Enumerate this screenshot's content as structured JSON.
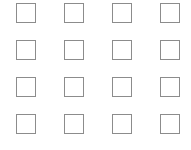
{
  "grid": {
    "name": "checkbox-grid",
    "rows": 4,
    "columns": 4,
    "total": 16,
    "background_color": "#ffffff",
    "box": {
      "width_px": 20,
      "height_px": 20,
      "border_width_px": 1,
      "border_color": "#8c8c8c",
      "fill_color": "#ffffff"
    },
    "layout": {
      "origin_x_px": 16,
      "origin_y_px": 3,
      "column_pitch_px": 48,
      "row_pitch_px": 37
    },
    "items": [
      {
        "name": "checkbox-r1c1",
        "row": 1,
        "column": 1,
        "x": 16,
        "y": 3,
        "checked": false,
        "mark": ""
      },
      {
        "name": "checkbox-r1c2",
        "row": 1,
        "column": 2,
        "x": 64,
        "y": 3,
        "checked": false,
        "mark": ""
      },
      {
        "name": "checkbox-r1c3",
        "row": 1,
        "column": 3,
        "x": 112,
        "y": 3,
        "checked": false,
        "mark": ""
      },
      {
        "name": "checkbox-r1c4",
        "row": 1,
        "column": 4,
        "x": 160,
        "y": 3,
        "checked": false,
        "mark": ""
      },
      {
        "name": "checkbox-r2c1",
        "row": 2,
        "column": 1,
        "x": 16,
        "y": 40,
        "checked": false,
        "mark": ""
      },
      {
        "name": "checkbox-r2c2",
        "row": 2,
        "column": 2,
        "x": 64,
        "y": 40,
        "checked": false,
        "mark": ""
      },
      {
        "name": "checkbox-r2c3",
        "row": 2,
        "column": 3,
        "x": 112,
        "y": 40,
        "checked": false,
        "mark": ""
      },
      {
        "name": "checkbox-r2c4",
        "row": 2,
        "column": 4,
        "x": 160,
        "y": 40,
        "checked": false,
        "mark": ""
      },
      {
        "name": "checkbox-r3c1",
        "row": 3,
        "column": 1,
        "x": 16,
        "y": 77,
        "checked": false,
        "mark": ""
      },
      {
        "name": "checkbox-r3c2",
        "row": 3,
        "column": 2,
        "x": 64,
        "y": 77,
        "checked": false,
        "mark": ""
      },
      {
        "name": "checkbox-r3c3",
        "row": 3,
        "column": 3,
        "x": 112,
        "y": 77,
        "checked": false,
        "mark": ""
      },
      {
        "name": "checkbox-r3c4",
        "row": 3,
        "column": 4,
        "x": 160,
        "y": 77,
        "checked": false,
        "mark": ""
      },
      {
        "name": "checkbox-r4c1",
        "row": 4,
        "column": 1,
        "x": 16,
        "y": 114,
        "checked": false,
        "mark": ""
      },
      {
        "name": "checkbox-r4c2",
        "row": 4,
        "column": 2,
        "x": 64,
        "y": 114,
        "checked": false,
        "mark": ""
      },
      {
        "name": "checkbox-r4c3",
        "row": 4,
        "column": 3,
        "x": 112,
        "y": 114,
        "checked": false,
        "mark": ""
      },
      {
        "name": "checkbox-r4c4",
        "row": 4,
        "column": 4,
        "x": 160,
        "y": 114,
        "checked": false,
        "mark": ""
      }
    ]
  }
}
